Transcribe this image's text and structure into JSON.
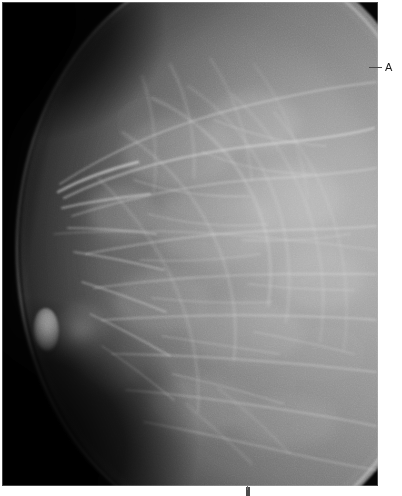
{
  "figure": {
    "kind": "mammogram",
    "view": "craniocaudal",
    "laterality_side": "anterior-left",
    "background_color": "#ffffff",
    "panel_color": "#050505",
    "tissue_highlight_color": "#d2d2d2"
  },
  "panel": {
    "name": "mammogram-image",
    "x": 2,
    "y": 2,
    "width": 376,
    "height": 484
  },
  "annotations": [
    {
      "id": "a",
      "label": "A",
      "label_color": "#1a1a1a",
      "leader_color": "#4a4a4a",
      "x": 369,
      "y": 62,
      "points_to": "skin-line-posterior-margin"
    }
  ],
  "features": {
    "nipple": "nipple-in-profile",
    "skin_line": "skin-line",
    "parenchyma": "fibroglandular-tissue",
    "background_field": "unexposed-black-field"
  },
  "edge_marker": {
    "label": "",
    "visible": true
  }
}
